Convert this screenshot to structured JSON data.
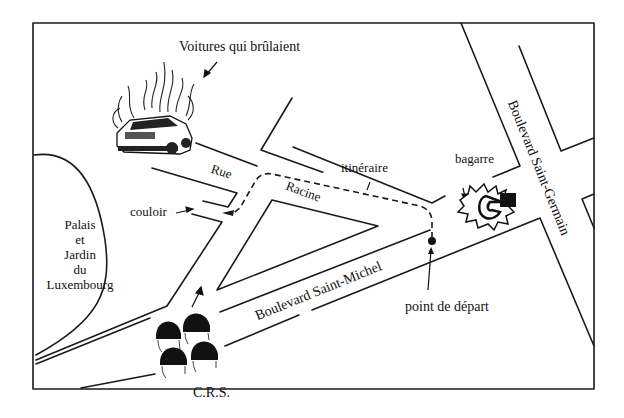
{
  "map": {
    "title": "Itinéraire — Quartier Latin",
    "frame": {
      "stroke": "#1a1a1a"
    },
    "labels": {
      "burning_cars": "Voitures qui brûlaient",
      "rue": "Rue",
      "racine": "Racine",
      "itinerary": "itinéraire",
      "fight": "bagarre",
      "corridor": "couloir",
      "park": [
        "Palais",
        "et",
        "Jardin",
        "du",
        "Luxembourg"
      ],
      "bd_saint_michel": "Boulevard Saint-Michel",
      "bd_saint_germain": "Boulevard Saint-Germain",
      "start_point": "point de départ",
      "riot_police": "C.R.S."
    },
    "icons": {
      "burning_car": "burning-car-icon",
      "fight": "fight-fist-icon",
      "police": "helmet-icon",
      "start": "start-dot-icon"
    },
    "colors": {
      "ink": "#111111",
      "paper": "#ffffff"
    }
  }
}
